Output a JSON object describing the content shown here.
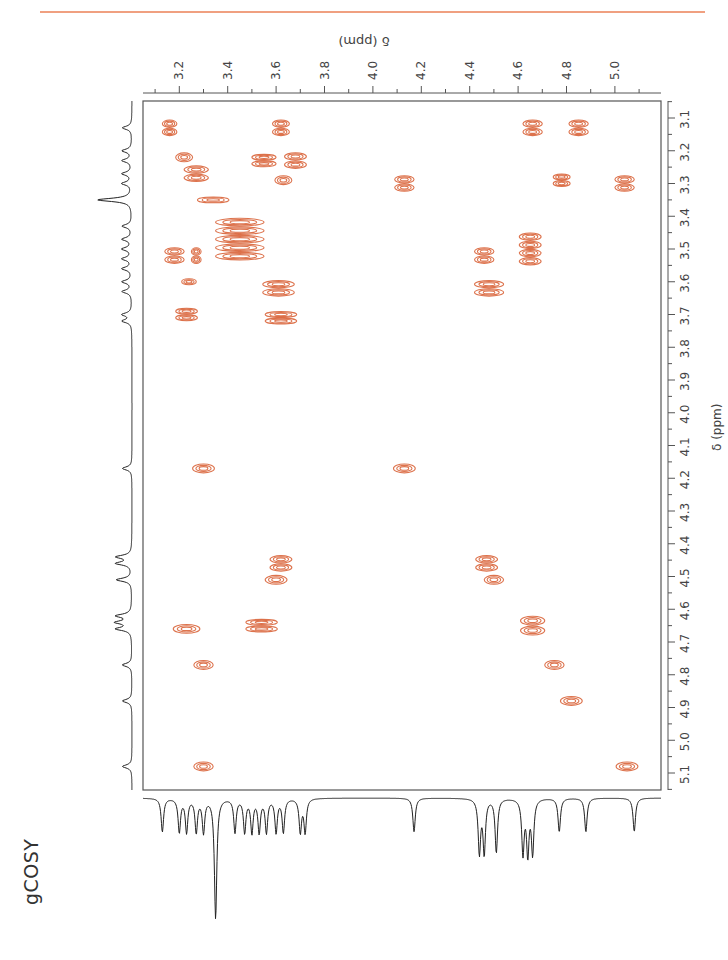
{
  "page": {
    "title": "gCOSY",
    "top_axis_label": "δ (ppm)",
    "right_axis_label": "δ (ppm)",
    "accent_rule_color": "#f0a080",
    "contour_color": "#d9643a"
  },
  "chart_data": {
    "type": "heatmap",
    "subtype": "2D NMR COSY contour plot",
    "title": "gCOSY",
    "xlabel": "δ (ppm)",
    "ylabel": "δ (ppm)",
    "x_axis": {
      "position": "top",
      "range": [
        3.05,
        5.2
      ],
      "ticks": [
        3.2,
        3.4,
        3.6,
        3.8,
        4.0,
        4.2,
        4.4,
        4.6,
        4.8,
        5.0
      ]
    },
    "y_axis": {
      "position": "right",
      "range": [
        3.05,
        5.15
      ],
      "ticks": [
        3.1,
        3.2,
        3.3,
        3.4,
        3.5,
        3.6,
        3.7,
        3.8,
        3.9,
        4.0,
        4.1,
        4.2,
        4.3,
        4.4,
        4.5,
        4.6,
        4.7,
        4.8,
        4.9,
        5.0,
        5.1
      ]
    },
    "grid": false,
    "projections": [
      "left 1D 1H spectrum",
      "bottom 1D 1H spectrum"
    ],
    "cross_peaks": [
      {
        "x": 3.16,
        "y": 3.13,
        "w": 0.06,
        "h": 0.05
      },
      {
        "x": 3.62,
        "y": 3.13,
        "w": 0.07,
        "h": 0.05
      },
      {
        "x": 4.66,
        "y": 3.13,
        "w": 0.08,
        "h": 0.05
      },
      {
        "x": 4.85,
        "y": 3.13,
        "w": 0.08,
        "h": 0.05
      },
      {
        "x": 3.22,
        "y": 3.22,
        "w": 0.07,
        "h": 0.03
      },
      {
        "x": 3.55,
        "y": 3.23,
        "w": 0.1,
        "h": 0.04
      },
      {
        "x": 3.68,
        "y": 3.23,
        "w": 0.09,
        "h": 0.05
      },
      {
        "x": 3.27,
        "y": 3.27,
        "w": 0.1,
        "h": 0.05
      },
      {
        "x": 3.63,
        "y": 3.29,
        "w": 0.07,
        "h": 0.03
      },
      {
        "x": 4.13,
        "y": 3.3,
        "w": 0.08,
        "h": 0.05
      },
      {
        "x": 4.78,
        "y": 3.29,
        "w": 0.07,
        "h": 0.04
      },
      {
        "x": 5.04,
        "y": 3.3,
        "w": 0.08,
        "h": 0.05
      },
      {
        "x": 3.34,
        "y": 3.35,
        "w": 0.13,
        "h": 0.02
      },
      {
        "x": 3.45,
        "y": 3.47,
        "w": 0.2,
        "h": 0.13
      },
      {
        "x": 3.18,
        "y": 3.52,
        "w": 0.08,
        "h": 0.05
      },
      {
        "x": 3.27,
        "y": 3.52,
        "w": 0.04,
        "h": 0.05
      },
      {
        "x": 4.46,
        "y": 3.52,
        "w": 0.08,
        "h": 0.05
      },
      {
        "x": 4.65,
        "y": 3.5,
        "w": 0.09,
        "h": 0.1
      },
      {
        "x": 3.24,
        "y": 3.6,
        "w": 0.06,
        "h": 0.02
      },
      {
        "x": 3.61,
        "y": 3.62,
        "w": 0.13,
        "h": 0.05
      },
      {
        "x": 4.48,
        "y": 3.62,
        "w": 0.12,
        "h": 0.05
      },
      {
        "x": 3.23,
        "y": 3.7,
        "w": 0.09,
        "h": 0.04
      },
      {
        "x": 3.62,
        "y": 3.71,
        "w": 0.13,
        "h": 0.04
      },
      {
        "x": 3.3,
        "y": 4.17,
        "w": 0.09,
        "h": 0.03
      },
      {
        "x": 4.13,
        "y": 4.17,
        "w": 0.09,
        "h": 0.03
      },
      {
        "x": 3.62,
        "y": 4.46,
        "w": 0.09,
        "h": 0.05
      },
      {
        "x": 4.47,
        "y": 4.46,
        "w": 0.09,
        "h": 0.05
      },
      {
        "x": 3.6,
        "y": 4.51,
        "w": 0.09,
        "h": 0.03
      },
      {
        "x": 4.5,
        "y": 4.51,
        "w": 0.08,
        "h": 0.03
      },
      {
        "x": 3.54,
        "y": 4.65,
        "w": 0.13,
        "h": 0.04
      },
      {
        "x": 3.23,
        "y": 4.66,
        "w": 0.11,
        "h": 0.03
      },
      {
        "x": 4.66,
        "y": 4.65,
        "w": 0.1,
        "h": 0.06
      },
      {
        "x": 3.3,
        "y": 4.77,
        "w": 0.08,
        "h": 0.03
      },
      {
        "x": 4.75,
        "y": 4.77,
        "w": 0.08,
        "h": 0.03
      },
      {
        "x": 4.82,
        "y": 4.88,
        "w": 0.09,
        "h": 0.03
      },
      {
        "x": 3.3,
        "y": 5.08,
        "w": 0.08,
        "h": 0.03
      },
      {
        "x": 5.05,
        "y": 5.08,
        "w": 0.09,
        "h": 0.03
      }
    ],
    "proton_1d_peaks_ppm": [
      3.13,
      3.2,
      3.23,
      3.27,
      3.3,
      3.35,
      3.43,
      3.47,
      3.5,
      3.53,
      3.56,
      3.6,
      3.63,
      3.7,
      3.72,
      4.17,
      4.44,
      4.46,
      4.51,
      4.62,
      4.64,
      4.66,
      4.77,
      4.88,
      5.08
    ],
    "tallest_1d_peak_ppm": 3.35
  }
}
